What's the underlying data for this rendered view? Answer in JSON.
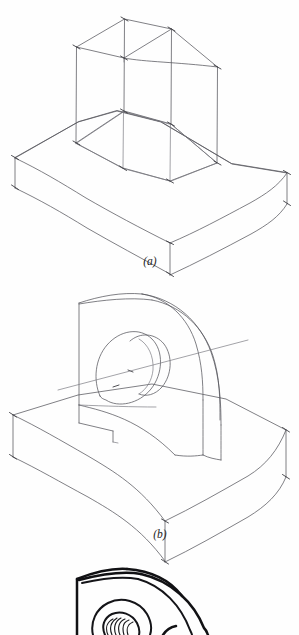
{
  "sheet": {
    "background_color": "#fefefe",
    "ink_color": "#56565c",
    "heavy_ink_color": "#111114",
    "width": 299,
    "height": 635
  },
  "figures": [
    {
      "id": "fig-a",
      "caption": "(a)",
      "caption_x": 150,
      "caption_y": 265,
      "description": "Wireframe block-in construction of a base slab with an upright rectangular prism",
      "stage": "construction-wireframe",
      "line_weight": "light"
    },
    {
      "id": "fig-b",
      "caption": "(b)",
      "caption_x": 160,
      "caption_y": 538,
      "description": "Refined outline: base slab with arched upright containing a through cylindrical hole and axis line",
      "stage": "refined-outline",
      "line_weight": "light"
    },
    {
      "id": "fig-c",
      "caption": "",
      "description": "Darkened final rendering of the arched upright with threaded hole, cropped at the bottom edge of the sheet",
      "stage": "final-darkened",
      "line_weight": "heavy"
    }
  ],
  "captions": {
    "a": "(a)",
    "b": "(b)"
  }
}
